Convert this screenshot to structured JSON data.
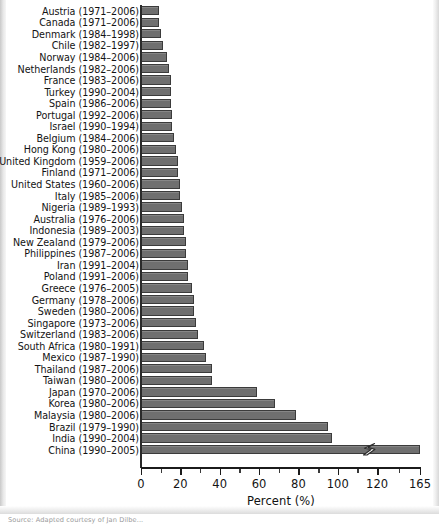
{
  "figure": {
    "caption_source": "Source: Adapted courtesy of Jan Dilbe..."
  },
  "chart_data": {
    "type": "bar",
    "orientation": "horizontal",
    "title": "",
    "xlabel": "Percent (%)",
    "ylabel": "",
    "xlim": [
      0,
      165
    ],
    "grid": false,
    "legend": null,
    "axis_break": {
      "present": true,
      "series_with_break": "China (1990–2005)",
      "note": "Axis compressed between 120 and 165; zigzag break drawn on the China bar"
    },
    "tick_labels": [
      "0",
      "20",
      "40",
      "60",
      "80",
      "100",
      "120",
      "165"
    ],
    "tick_values": [
      0,
      20,
      40,
      60,
      80,
      100,
      120,
      165
    ],
    "categories": [
      "Austria (1971–2006)",
      "Canada (1971–2006)",
      "Denmark  (1984–1998)",
      "Chile (1982–1997)",
      "Norway (1984–2006)",
      "Netherlands (1982–2006)",
      "France (1983–2006)",
      "Turkey (1990–2004)",
      "Spain (1986–2006)",
      "Portugal (1992–2006)",
      "Israel (1990–1994)",
      "Belgium (1984–2006)",
      "Hong Kong (1980–2006)",
      "United Kingdom (1959–2006)",
      "Finland (1971–2006)",
      "United States (1960–2006)",
      "Italy (1985–2006)",
      "Nigeria (1989–1993)",
      "Australia (1976–2006)",
      "Indonesia (1989–2003)",
      "New Zealand (1979–2006)",
      "Philippines (1987–2006)",
      "Iran (1991–2004)",
      "Poland (1991–2006)",
      "Greece (1976–2005)",
      "Germany (1978–2006)",
      "Sweden (1980–2006)",
      "Singapore (1973–2006)",
      "Switzerland (1983–2006)",
      "South Africa (1980–1991)",
      "Mexico (1987–1990)",
      "Thailand (1987–2006)",
      "Taiwan (1980–2006)",
      "Japan (1970–2006)",
      "Korea (1980–2006)",
      "Malaysia (1980–2006)",
      "Brazil (1979–1990)",
      "India (1990–2004)",
      "China (1990–2005)"
    ],
    "values": [
      9,
      9,
      10,
      11,
      13,
      14,
      15,
      15,
      15,
      16,
      16,
      17,
      18,
      19,
      19,
      20,
      20,
      21,
      22,
      22,
      23,
      23,
      24,
      24,
      26,
      27,
      27,
      28,
      29,
      32,
      33,
      36,
      36,
      59,
      68,
      79,
      95,
      97,
      165
    ]
  }
}
